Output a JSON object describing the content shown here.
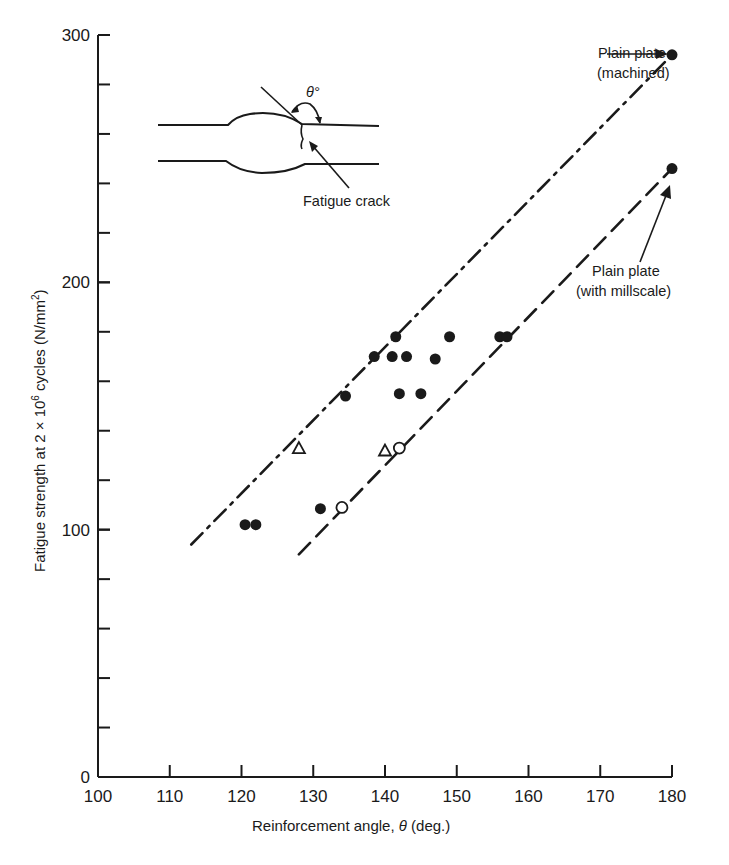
{
  "chart_data": {
    "type": "scatter",
    "title": "",
    "xlabel": "Reinforcement angle, θ (deg.)",
    "ylabel": "Fatigue strength at 2 × 10⁶ cycles (N/mm²)",
    "xlim": [
      100,
      180
    ],
    "ylim": [
      0,
      300
    ],
    "grid": false,
    "legend": "none",
    "x_ticks": [
      100,
      110,
      120,
      130,
      140,
      150,
      160,
      170,
      180
    ],
    "y_ticks_labeled": [
      0,
      100,
      200,
      300
    ],
    "y_minor_step": 20,
    "series": [
      {
        "name": "Filled circles",
        "marker": "filled-circle",
        "points": [
          [
            120.5,
            102
          ],
          [
            122,
            102
          ],
          [
            131,
            108.5
          ],
          [
            134.5,
            154
          ],
          [
            138.5,
            170
          ],
          [
            141,
            170
          ],
          [
            141.5,
            178
          ],
          [
            143,
            170
          ],
          [
            142,
            155
          ],
          [
            145,
            155
          ],
          [
            147,
            169
          ],
          [
            149,
            178
          ],
          [
            156,
            178
          ],
          [
            157,
            178
          ]
        ]
      },
      {
        "name": "Open circles",
        "marker": "open-circle",
        "points": [
          [
            134,
            109
          ],
          [
            142,
            133
          ]
        ]
      },
      {
        "name": "Open triangles",
        "marker": "open-triangle",
        "points": [
          [
            128,
            133
          ],
          [
            140,
            132
          ]
        ]
      },
      {
        "name": "Plain plate (machined)",
        "marker": "filled-circle",
        "points": [
          [
            180,
            292
          ]
        ]
      },
      {
        "name": "Plain plate (with millscale)",
        "marker": "filled-circle",
        "points": [
          [
            180,
            246
          ]
        ]
      }
    ],
    "lines": [
      {
        "name": "Upper bound (dash-dot)",
        "style": "dash-dot",
        "from": [
          113,
          94
        ],
        "to": [
          180,
          292
        ]
      },
      {
        "name": "Lower bound (dashed)",
        "style": "dashed",
        "from": [
          128,
          90
        ],
        "to": [
          180,
          246
        ]
      }
    ],
    "annotations": [
      {
        "text": [
          "Plain plate",
          "(machined)"
        ],
        "points_to": [
          180,
          292
        ]
      },
      {
        "text": [
          "Plain plate",
          "(with millscale)"
        ],
        "points_to": [
          180,
          246
        ]
      },
      {
        "text": [
          "Fatigue crack"
        ],
        "role": "inset-diagram"
      },
      {
        "text": [
          "θ°"
        ],
        "role": "inset-diagram-angle"
      }
    ]
  },
  "labels": {
    "xlabel_prefix": "Reinforcement angle, ",
    "xlabel_theta": "θ",
    "xlabel_suffix": " (deg.)",
    "ylabel_a": "Fatigue strength at 2 × 10",
    "ylabel_exp": "6",
    "ylabel_b": " cycles (N/mm",
    "ylabel_exp2": "2",
    "ylabel_c": ")",
    "machined_1": "Plain plate",
    "machined_2": "(machined)",
    "millscale_1": "Plain plate",
    "millscale_2": "(with millscale)",
    "fatigue_crack": "Fatigue crack",
    "theta_deg": "θ°"
  },
  "colors": {
    "ink": "#1a1a1a",
    "background": "#ffffff"
  }
}
